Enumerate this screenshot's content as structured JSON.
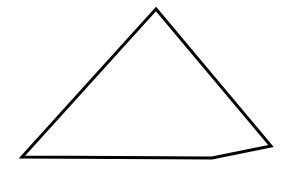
{
  "diagram": {
    "shape": "quadrilateral",
    "stroke_color": "#000000",
    "fill_color": "#ffffff",
    "stroke_width": 3,
    "vertices": [
      {
        "name": "apex",
        "x": 156,
        "y": 9
      },
      {
        "name": "right",
        "x": 271,
        "y": 146
      },
      {
        "name": "bottom-right",
        "x": 212,
        "y": 158
      },
      {
        "name": "bottom-left",
        "x": 22,
        "y": 157
      }
    ]
  }
}
